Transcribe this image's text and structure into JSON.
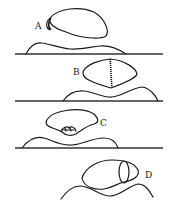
{
  "diagram": {
    "panels": [
      {
        "id": "A",
        "label": "A",
        "description": "egg-shaped body resting above hills with small crescent cap at left end"
      },
      {
        "id": "B",
        "label": "B",
        "description": "lens-shaped body with vertical beaded seam through middle"
      },
      {
        "id": "C",
        "label": "C",
        "description": "fan-shaped body with small knotted feature at bottom center"
      },
      {
        "id": "D",
        "label": "D",
        "description": "tilted oval body with cross-section ring near right end"
      }
    ],
    "divider_lines": 3,
    "colors": {
      "ink": "#1a1a1a",
      "background": "#ffffff"
    }
  }
}
